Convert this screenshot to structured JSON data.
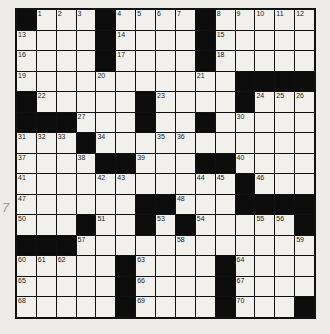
{
  "puzzle": {
    "rows": 15,
    "cols": 15,
    "grid": [
      "#...#....#.....",
      "....#....#.....",
      "....#....#.....",
      "...........####",
      "#.....#....#...",
      "###...#..#.....",
      "...#...........",
      "....##...##....",
      "...........#...",
      "......##...####",
      "...#..#.#.....#",
      "###............",
      ".....#....#....",
      ".....#....#....",
      ".....#....#...#"
    ],
    "numbers": [
      [
        0,
        1,
        1
      ],
      [
        0,
        2,
        2
      ],
      [
        0,
        3,
        3
      ],
      [
        0,
        5,
        4
      ],
      [
        0,
        6,
        5
      ],
      [
        0,
        7,
        6
      ],
      [
        0,
        8,
        7
      ],
      [
        0,
        10,
        8
      ],
      [
        0,
        11,
        9
      ],
      [
        0,
        12,
        10
      ],
      [
        0,
        13,
        11
      ],
      [
        0,
        14,
        12
      ],
      [
        1,
        0,
        13
      ],
      [
        1,
        5,
        14
      ],
      [
        1,
        10,
        15
      ],
      [
        2,
        0,
        16
      ],
      [
        2,
        5,
        17
      ],
      [
        2,
        10,
        18
      ],
      [
        3,
        0,
        19
      ],
      [
        3,
        4,
        20
      ],
      [
        3,
        9,
        21
      ],
      [
        4,
        1,
        22
      ],
      [
        4,
        7,
        23
      ],
      [
        4,
        12,
        24
      ],
      [
        4,
        13,
        25
      ],
      [
        4,
        14,
        26
      ],
      [
        5,
        3,
        27
      ],
      [
        5,
        6,
        28
      ],
      [
        5,
        9,
        29
      ],
      [
        5,
        11,
        30
      ],
      [
        6,
        0,
        31
      ],
      [
        6,
        1,
        32
      ],
      [
        6,
        2,
        33
      ],
      [
        6,
        4,
        34
      ],
      [
        6,
        7,
        35
      ],
      [
        6,
        8,
        36
      ],
      [
        7,
        0,
        37
      ],
      [
        7,
        3,
        38
      ],
      [
        7,
        6,
        39
      ],
      [
        7,
        11,
        40
      ],
      [
        8,
        0,
        41
      ],
      [
        8,
        4,
        42
      ],
      [
        8,
        5,
        43
      ],
      [
        8,
        9,
        44
      ],
      [
        8,
        10,
        45
      ],
      [
        8,
        12,
        46
      ],
      [
        9,
        0,
        47
      ],
      [
        9,
        8,
        48
      ],
      [
        9,
        11,
        49
      ],
      [
        10,
        0,
        50
      ],
      [
        10,
        4,
        51
      ],
      [
        10,
        6,
        52
      ],
      [
        10,
        7,
        53
      ],
      [
        10,
        9,
        54
      ],
      [
        10,
        12,
        55
      ],
      [
        10,
        13,
        56
      ],
      [
        11,
        3,
        57
      ],
      [
        11,
        8,
        58
      ],
      [
        11,
        14,
        59
      ],
      [
        12,
        0,
        60
      ],
      [
        12,
        1,
        61
      ],
      [
        12,
        2,
        62
      ],
      [
        12,
        6,
        63
      ],
      [
        12,
        11,
        64
      ],
      [
        13,
        0,
        65
      ],
      [
        13,
        6,
        66
      ],
      [
        13,
        11,
        67
      ],
      [
        14,
        0,
        68
      ],
      [
        14,
        6,
        69
      ],
      [
        14,
        11,
        70
      ]
    ]
  },
  "margin_mark": "7"
}
